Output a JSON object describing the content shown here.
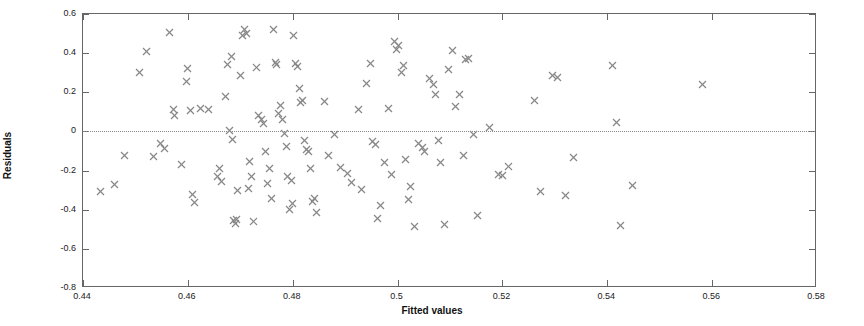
{
  "chart_data": {
    "type": "scatter",
    "title": "",
    "xlabel": "Fitted values",
    "ylabel": "Residuals",
    "xlim": [
      0.44,
      0.58
    ],
    "ylim": [
      -0.8,
      0.6
    ],
    "xticks": [
      0.44,
      0.46,
      0.48,
      0.5,
      0.52,
      0.54,
      0.56,
      0.58
    ],
    "xticklabels": [
      "0.44",
      "0.46",
      "0.48",
      "0.5",
      "0.52",
      "0.54",
      "0.56",
      "0.58"
    ],
    "yticks": [
      -0.8,
      -0.6,
      -0.4,
      -0.2,
      0,
      0.2,
      0.4,
      0.6
    ],
    "yticklabels": [
      "-0.8",
      "-0.6",
      "-0.4",
      "-0.2",
      "0",
      "0.2",
      "0.4",
      "0.6"
    ],
    "grid": false,
    "legend": null,
    "marker": "x",
    "marker_color": "#888888",
    "reference_line": {
      "type": "horizontal",
      "y": 0,
      "style": "dotted",
      "color": "#8a8a8a"
    },
    "series": [
      {
        "name": "Residuals vs Fitted values",
        "points": [
          [
            0.4433,
            -0.305
          ],
          [
            0.446,
            -0.27
          ],
          [
            0.448,
            -0.122
          ],
          [
            0.4508,
            0.3
          ],
          [
            0.4521,
            0.41
          ],
          [
            0.4535,
            -0.13
          ],
          [
            0.4548,
            -0.062
          ],
          [
            0.4556,
            -0.085
          ],
          [
            0.4565,
            0.505
          ],
          [
            0.4572,
            0.112
          ],
          [
            0.4575,
            0.08
          ],
          [
            0.4588,
            -0.17
          ],
          [
            0.4597,
            0.253
          ],
          [
            0.46,
            0.32
          ],
          [
            0.4605,
            0.108
          ],
          [
            0.4608,
            -0.32
          ],
          [
            0.4612,
            -0.365
          ],
          [
            0.4625,
            0.118
          ],
          [
            0.464,
            0.112
          ],
          [
            0.4656,
            -0.228
          ],
          [
            0.466,
            -0.19
          ],
          [
            0.4665,
            -0.255
          ],
          [
            0.4672,
            0.178
          ],
          [
            0.4676,
            0.34
          ],
          [
            0.468,
            0.005
          ],
          [
            0.4684,
            0.383
          ],
          [
            0.4686,
            -0.04
          ],
          [
            0.4688,
            -0.455
          ],
          [
            0.469,
            -0.47
          ],
          [
            0.4692,
            -0.448
          ],
          [
            0.4695,
            -0.3
          ],
          [
            0.47,
            0.285
          ],
          [
            0.4704,
            0.49
          ],
          [
            0.4708,
            0.52
          ],
          [
            0.4712,
            0.5
          ],
          [
            0.4715,
            -0.29
          ],
          [
            0.4718,
            -0.152
          ],
          [
            0.4722,
            -0.232
          ],
          [
            0.4726,
            -0.458
          ],
          [
            0.473,
            0.325
          ],
          [
            0.4735,
            0.08
          ],
          [
            0.474,
            0.06
          ],
          [
            0.4744,
            0.04
          ],
          [
            0.4748,
            -0.1
          ],
          [
            0.4752,
            -0.265
          ],
          [
            0.4756,
            -0.19
          ],
          [
            0.476,
            -0.345
          ],
          [
            0.4764,
            0.52
          ],
          [
            0.4768,
            0.35
          ],
          [
            0.477,
            0.34
          ],
          [
            0.4772,
            0.09
          ],
          [
            0.4776,
            0.13
          ],
          [
            0.478,
            0.06
          ],
          [
            0.4784,
            -0.012
          ],
          [
            0.4788,
            -0.078
          ],
          [
            0.479,
            -0.228
          ],
          [
            0.4794,
            -0.4
          ],
          [
            0.4798,
            -0.25
          ],
          [
            0.48,
            -0.37
          ],
          [
            0.4802,
            0.49
          ],
          [
            0.4806,
            0.345
          ],
          [
            0.481,
            0.33
          ],
          [
            0.4812,
            0.22
          ],
          [
            0.4815,
            0.15
          ],
          [
            0.4818,
            0.158
          ],
          [
            0.4822,
            -0.045
          ],
          [
            0.4826,
            -0.092
          ],
          [
            0.483,
            -0.105
          ],
          [
            0.4834,
            -0.19
          ],
          [
            0.4838,
            -0.36
          ],
          [
            0.4842,
            -0.345
          ],
          [
            0.4846,
            -0.415
          ],
          [
            0.486,
            0.155
          ],
          [
            0.4868,
            -0.125
          ],
          [
            0.488,
            -0.018
          ],
          [
            0.4892,
            -0.185
          ],
          [
            0.4905,
            -0.215
          ],
          [
            0.4912,
            -0.262
          ],
          [
            0.4925,
            0.112
          ],
          [
            0.4932,
            -0.295
          ],
          [
            0.494,
            0.243
          ],
          [
            0.4948,
            0.345
          ],
          [
            0.4952,
            -0.052
          ],
          [
            0.4958,
            -0.065
          ],
          [
            0.4962,
            -0.445
          ],
          [
            0.4968,
            -0.378
          ],
          [
            0.4975,
            -0.16
          ],
          [
            0.4982,
            0.118
          ],
          [
            0.4988,
            -0.22
          ],
          [
            0.4995,
            0.46
          ],
          [
            0.4998,
            0.42
          ],
          [
            0.5002,
            0.44
          ],
          [
            0.5008,
            0.3
          ],
          [
            0.5012,
            0.335
          ],
          [
            0.5015,
            -0.145
          ],
          [
            0.502,
            -0.35
          ],
          [
            0.5025,
            -0.282
          ],
          [
            0.5032,
            -0.488
          ],
          [
            0.504,
            -0.06
          ],
          [
            0.5048,
            -0.082
          ],
          [
            0.5052,
            -0.1
          ],
          [
            0.506,
            0.27
          ],
          [
            0.5068,
            0.238
          ],
          [
            0.5072,
            0.19
          ],
          [
            0.5078,
            -0.048
          ],
          [
            0.5082,
            -0.16
          ],
          [
            0.509,
            -0.478
          ],
          [
            0.5098,
            0.318
          ],
          [
            0.5105,
            0.415
          ],
          [
            0.511,
            0.128
          ],
          [
            0.5118,
            0.188
          ],
          [
            0.5125,
            -0.125
          ],
          [
            0.513,
            0.368
          ],
          [
            0.5135,
            0.375
          ],
          [
            0.5145,
            -0.018
          ],
          [
            0.5152,
            -0.428
          ],
          [
            0.5175,
            0.018
          ],
          [
            0.5192,
            -0.218
          ],
          [
            0.52,
            -0.225
          ],
          [
            0.5212,
            -0.178
          ],
          [
            0.5262,
            0.158
          ],
          [
            0.5272,
            -0.305
          ],
          [
            0.5295,
            0.288
          ],
          [
            0.5305,
            0.278
          ],
          [
            0.532,
            -0.325
          ],
          [
            0.5335,
            -0.132
          ],
          [
            0.541,
            0.335
          ],
          [
            0.5418,
            0.048
          ],
          [
            0.5425,
            -0.482
          ],
          [
            0.5448,
            -0.278
          ],
          [
            0.5582,
            0.238
          ]
        ]
      }
    ]
  },
  "axes": {
    "x_axis_label": "Fitted values",
    "y_axis_label": "Residuals"
  }
}
